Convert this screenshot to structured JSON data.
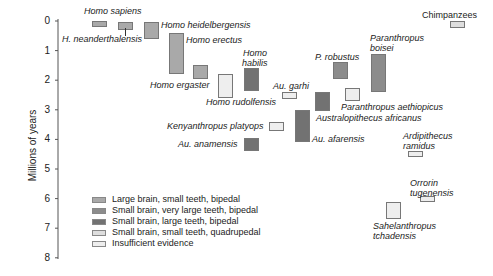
{
  "chart_data": {
    "type": "range-bar",
    "title": "",
    "ylabel": "Millions of years",
    "xlabel": "",
    "ylim": [
      0,
      8
    ],
    "y_inverted": true,
    "yticks": [
      "0",
      "1",
      "2",
      "3",
      "4",
      "5",
      "6",
      "7",
      "8"
    ],
    "legend": [
      {
        "key": "large_brain",
        "label": "Large brain, small teeth, bipedal",
        "color": "#a9a9a9"
      },
      {
        "key": "very_large_teeth",
        "label": "Small brain, very large teeth, bipedal",
        "color": "#8c8c8c"
      },
      {
        "key": "large_teeth",
        "label": "Small brain, large teeth, bipedal",
        "color": "#727272"
      },
      {
        "key": "quadrupedal",
        "label": "Small brain, small teeth, quadrupedal",
        "color": "#dedede"
      },
      {
        "key": "insufficient",
        "label": "Insufficient evidence",
        "color": "#eeeeee"
      }
    ],
    "series": [
      {
        "name": "Homo sapiens",
        "start": 0.0,
        "end": 0.2,
        "category": "large_brain"
      },
      {
        "name": "H. neanderthalensis",
        "start": 0.03,
        "end": 0.3,
        "category": "large_brain"
      },
      {
        "name": "Homo heidelbergensis",
        "start": 0.05,
        "end": 0.6,
        "category": "large_brain"
      },
      {
        "name": "Homo erectus",
        "start": 0.4,
        "end": 1.8,
        "category": "large_brain"
      },
      {
        "name": "Homo ergaster",
        "start": 1.5,
        "end": 1.95,
        "category": "large_brain"
      },
      {
        "name": "Homo rudolfensis",
        "start": 1.8,
        "end": 2.6,
        "category": "insufficient"
      },
      {
        "name": "Homo habilis",
        "start": 1.6,
        "end": 2.35,
        "category": "large_teeth"
      },
      {
        "name": "Au. garhi",
        "start": 2.4,
        "end": 2.65,
        "category": "insufficient"
      },
      {
        "name": "P. robustus",
        "start": 1.4,
        "end": 1.95,
        "category": "very_large_teeth"
      },
      {
        "name": "Paranthropus boisei",
        "start": 1.1,
        "end": 2.4,
        "category": "very_large_teeth"
      },
      {
        "name": "Paranthropus aethiopicus",
        "start": 2.25,
        "end": 2.7,
        "category": "insufficient"
      },
      {
        "name": "Australopithecus africanus",
        "start": 2.4,
        "end": 3.05,
        "category": "large_teeth"
      },
      {
        "name": "Kenyanthropus platyops",
        "start": 3.4,
        "end": 3.7,
        "category": "insufficient"
      },
      {
        "name": "Au. afarensis",
        "start": 3.0,
        "end": 4.1,
        "category": "large_teeth"
      },
      {
        "name": "Au. anamensis",
        "start": 3.95,
        "end": 4.4,
        "category": "large_teeth"
      },
      {
        "name": "Ardipithecus ramidus",
        "start": 4.4,
        "end": 4.6,
        "category": "insufficient"
      },
      {
        "name": "Orrorin tugenensis",
        "start": 5.9,
        "end": 6.1,
        "category": "insufficient"
      },
      {
        "name": "Sahelanthropus tchadensis",
        "start": 6.1,
        "end": 6.7,
        "category": "insufficient"
      },
      {
        "name": "Chimpanzees",
        "start": 0.0,
        "end": 0.25,
        "category": "quadrupedal"
      }
    ]
  },
  "labels": {
    "sapiens": "Homo sapiens",
    "neanderthalensis": "H. neanderthalensis",
    "heidelbergensis": "Homo heidelbergensis",
    "erectus": "Homo erectus",
    "ergaster": "Homo ergaster",
    "rudolfensis": "Homo rudolfensis",
    "habilis_1": "Homo",
    "habilis_2": "habilis",
    "garhi": "Au. garhi",
    "robustus": "P. robustus",
    "boisei_1": "Paranthropus",
    "boisei_2": "boisei",
    "aethiopicus": "Paranthropus aethiopicus",
    "africanus": "Australopithecus africanus",
    "platyops": "Kenyanthropus platyops",
    "afarensis": "Au. afarensis",
    "anamensis": "Au. anamensis",
    "ramidus_1": "Ardipithecus",
    "ramidus_2": "ramidus",
    "tugenensis_1": "Orrorin",
    "tugenensis_2": "tugenensis",
    "sahel_1": "Sahelanthropus",
    "sahel_2": "tchadensis",
    "chimps": "Chimpanzees"
  }
}
